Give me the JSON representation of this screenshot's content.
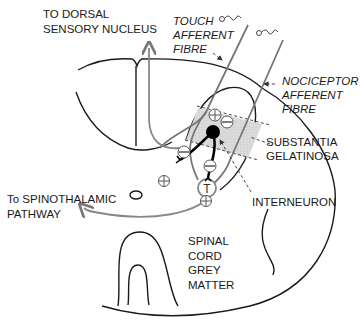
{
  "diagram": {
    "labels": {
      "dorsal_nucleus": [
        "TO DORSAL",
        "SENSORY NUCLEUS"
      ],
      "touch_fibre": [
        "TOUCH",
        "AFFERENT",
        "FIBRE"
      ],
      "nociceptor_fibre": [
        "NOCICEPTOR",
        "AFFERENT",
        "FIBRE"
      ],
      "substantia": [
        "SUBSTANTIA",
        "GELATINOSA"
      ],
      "spinothalamic": [
        "To SPINOTHALAMIC",
        "PATHWAY"
      ],
      "interneuron": "INTERNEURON",
      "grey_matter": [
        "SPINAL",
        "CORD",
        "GREY",
        "MATTER"
      ]
    },
    "symbols": {
      "plus": "+",
      "minus": "−",
      "transmission_cell": "T"
    },
    "colors": {
      "outline": "#1a1a1a",
      "fibre": "#777777",
      "substantia_fill": "#d9d9d9",
      "interneuron": "#000000"
    }
  }
}
